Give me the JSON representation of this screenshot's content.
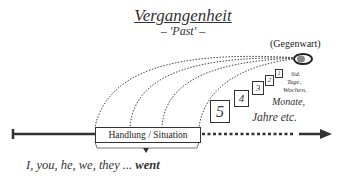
{
  "title": "Vergangenheit",
  "subtitle": "– 'Past' –",
  "present_label": "(Gegenwart)",
  "time_boxes": [
    {
      "label": "1",
      "unit": "Std."
    },
    {
      "label": "2",
      "unit": "Tage,"
    },
    {
      "label": "3",
      "unit": "Wochen,"
    },
    {
      "label": "4",
      "unit": "Monate,"
    },
    {
      "label": "5",
      "unit": "Jahre etc."
    }
  ],
  "situation_label": "Handlung / Situation",
  "sentence": {
    "subjects": "I, you, he, we, they ... ",
    "verb": "went"
  },
  "colors": {
    "line": "#333333",
    "present_marker": "#888888"
  }
}
